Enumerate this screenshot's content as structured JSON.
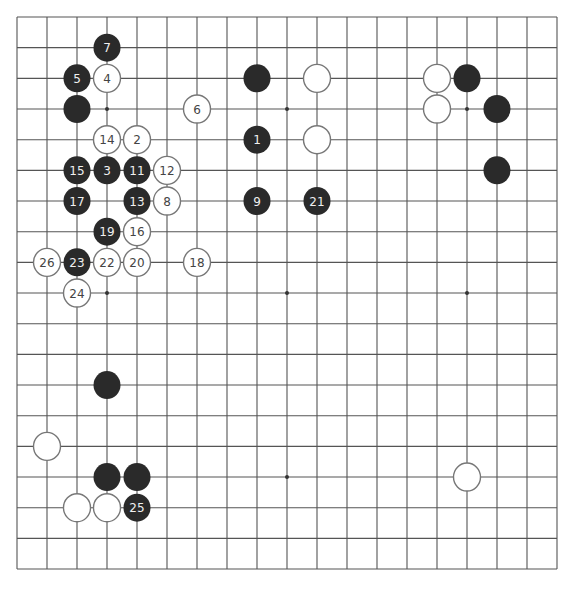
{
  "board": {
    "size": 19,
    "origin": {
      "x": 17,
      "y": 17
    },
    "spacing": {
      "x": 30,
      "y": 30.67
    },
    "line_color": "#555555",
    "background": "#ffffff",
    "star_points": [
      [
        3,
        3
      ],
      [
        9,
        3
      ],
      [
        15,
        3
      ],
      [
        3,
        9
      ],
      [
        9,
        9
      ],
      [
        15,
        9
      ],
      [
        3,
        15
      ],
      [
        9,
        15
      ],
      [
        15,
        15
      ]
    ],
    "stone_colors": {
      "black": "#2a2a2a",
      "white": "#ffffff",
      "white_border": "#777777",
      "black_text": "#f0f0f0",
      "white_text": "#444444"
    }
  },
  "stones": [
    {
      "color": "black",
      "col": 3,
      "row": 1,
      "label": "7"
    },
    {
      "color": "black",
      "col": 2,
      "row": 2,
      "label": "5"
    },
    {
      "color": "white",
      "col": 3,
      "row": 2,
      "label": "4"
    },
    {
      "color": "black",
      "col": 2,
      "row": 3,
      "label": ""
    },
    {
      "color": "white",
      "col": 6,
      "row": 3,
      "label": "6"
    },
    {
      "color": "white",
      "col": 3,
      "row": 4,
      "label": "14"
    },
    {
      "color": "white",
      "col": 4,
      "row": 4,
      "label": "2"
    },
    {
      "color": "black",
      "col": 2,
      "row": 5,
      "label": "15"
    },
    {
      "color": "black",
      "col": 3,
      "row": 5,
      "label": "3"
    },
    {
      "color": "black",
      "col": 4,
      "row": 5,
      "label": "11"
    },
    {
      "color": "white",
      "col": 5,
      "row": 5,
      "label": "12"
    },
    {
      "color": "black",
      "col": 2,
      "row": 6,
      "label": "17"
    },
    {
      "color": "black",
      "col": 4,
      "row": 6,
      "label": "13"
    },
    {
      "color": "white",
      "col": 5,
      "row": 6,
      "label": "8"
    },
    {
      "color": "black",
      "col": 3,
      "row": 7,
      "label": "19"
    },
    {
      "color": "white",
      "col": 4,
      "row": 7,
      "label": "16"
    },
    {
      "color": "white",
      "col": 1,
      "row": 8,
      "label": "26"
    },
    {
      "color": "black",
      "col": 2,
      "row": 8,
      "label": "23"
    },
    {
      "color": "white",
      "col": 3,
      "row": 8,
      "label": "22"
    },
    {
      "color": "white",
      "col": 4,
      "row": 8,
      "label": "20"
    },
    {
      "color": "white",
      "col": 6,
      "row": 8,
      "label": "18"
    },
    {
      "color": "white",
      "col": 2,
      "row": 9,
      "label": "24"
    },
    {
      "color": "black",
      "col": 8,
      "row": 2,
      "label": ""
    },
    {
      "color": "white",
      "col": 10,
      "row": 2,
      "label": ""
    },
    {
      "color": "black",
      "col": 8,
      "row": 4,
      "label": "1"
    },
    {
      "color": "white",
      "col": 10,
      "row": 4,
      "label": ""
    },
    {
      "color": "black",
      "col": 8,
      "row": 6,
      "label": "9"
    },
    {
      "color": "black",
      "col": 10,
      "row": 6,
      "label": "21"
    },
    {
      "color": "white",
      "col": 14,
      "row": 2,
      "label": ""
    },
    {
      "color": "black",
      "col": 15,
      "row": 2,
      "label": ""
    },
    {
      "color": "white",
      "col": 14,
      "row": 3,
      "label": ""
    },
    {
      "color": "black",
      "col": 16,
      "row": 3,
      "label": ""
    },
    {
      "color": "black",
      "col": 16,
      "row": 5,
      "label": ""
    },
    {
      "color": "black",
      "col": 3,
      "row": 12,
      "label": ""
    },
    {
      "color": "white",
      "col": 1,
      "row": 14,
      "label": ""
    },
    {
      "color": "black",
      "col": 3,
      "row": 15,
      "label": ""
    },
    {
      "color": "black",
      "col": 4,
      "row": 15,
      "label": ""
    },
    {
      "color": "white",
      "col": 15,
      "row": 15,
      "label": ""
    },
    {
      "color": "white",
      "col": 2,
      "row": 16,
      "label": ""
    },
    {
      "color": "white",
      "col": 3,
      "row": 16,
      "label": ""
    },
    {
      "color": "black",
      "col": 4,
      "row": 16,
      "label": "25"
    }
  ]
}
